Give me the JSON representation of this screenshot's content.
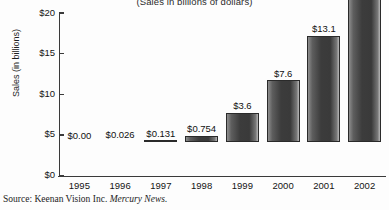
{
  "chart": {
    "title": "(Sales in billions of dollars)",
    "ylabel": "Sales (in billions)",
    "source_prefix": "Source: Keenan Vision Inc.",
    "source_publication": "Mercury News."
  },
  "chart_data": {
    "type": "bar",
    "title": "(Sales in billions of dollars)",
    "xlabel": "",
    "ylabel": "Sales (in billions)",
    "categories": [
      "1995",
      "1996",
      "1997",
      "1998",
      "1999",
      "2000",
      "2001",
      "2002"
    ],
    "values": [
      0.0,
      0.026,
      0.131,
      0.754,
      3.6,
      7.6,
      13.1,
      18.7
    ],
    "data_labels": [
      "$0.00",
      "$0.026",
      "$0.131",
      "$0.754",
      "$3.6",
      "$7.6",
      "$13.1",
      "$18.7"
    ],
    "ylim": [
      0,
      20
    ],
    "yticks": [
      0,
      5,
      10,
      15,
      20
    ],
    "ytick_labels": [
      "$0",
      "$5",
      "$10",
      "$15",
      "$20"
    ],
    "grid": false,
    "legend": false,
    "bar_color": "#3c3c3c",
    "background": "#ffffff"
  }
}
